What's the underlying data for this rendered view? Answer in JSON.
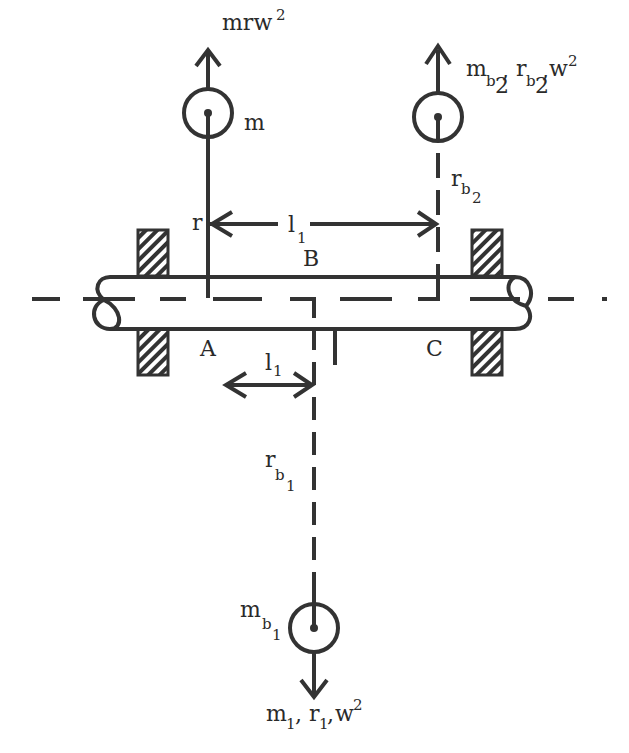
{
  "diagram": {
    "stroke_color": "#333333",
    "background": "#ffffff",
    "labels": {
      "top_force": {
        "base": "mrw",
        "sup": "2"
      },
      "mass_m": "m",
      "r_label": "r",
      "l1_top": {
        "base": "l",
        "sub": "1"
      },
      "point_B": "B",
      "point_A": "A",
      "point_C": "C",
      "l1_bottom": {
        "base": "l",
        "sub": "1"
      },
      "rb2": {
        "base": "r",
        "sub": "b",
        "subsub": "2"
      },
      "rb1": {
        "base": "r",
        "sub": "b",
        "subsub": "1"
      },
      "mb1": {
        "base": "m",
        "sub": "b",
        "subsub": "1"
      },
      "top_right_force": {
        "m": "m",
        "msub": "b",
        "msubsub": "2",
        "sep1": ",",
        "r": "r",
        "rsub": "b",
        "rsubsub": "2",
        "sep2": ",",
        "w": "w",
        "wsup": "2"
      },
      "bottom_force": {
        "m": "m",
        "msub": "1",
        "sep1": ",",
        "r": "r",
        "rsub": "1",
        "sep2": ",",
        "w": "w",
        "wsup": "2"
      }
    },
    "elements": [
      {
        "name": "mass m",
        "plane": "B",
        "direction": "up"
      },
      {
        "name": "balance mass mb2",
        "plane": "C",
        "direction": "up"
      },
      {
        "name": "balance mass mb1",
        "plane": "A",
        "direction": "down"
      },
      {
        "name": "left bearing"
      },
      {
        "name": "right bearing"
      },
      {
        "name": "shaft"
      }
    ]
  }
}
